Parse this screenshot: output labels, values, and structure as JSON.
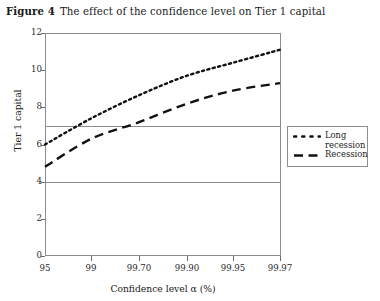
{
  "figure": {
    "label": "Figure 4",
    "caption": "The effect of the confidence level on Tier 1 capital"
  },
  "chart_data": {
    "type": "line",
    "title": "The effect of the confidence level on Tier 1 capital",
    "xlabel": "Confidence level α (%)",
    "ylabel": "Tier 1 capital",
    "categories": [
      "95",
      "99",
      "99.70",
      "99.90",
      "99.95",
      "99.97"
    ],
    "x_tick_labels": [
      "95",
      "99",
      "99.70",
      "99.90",
      "99.95",
      "99.97"
    ],
    "y_tick_labels": [
      "0",
      "2",
      "4",
      "6",
      "8",
      "10",
      "12"
    ],
    "y_ticks": [
      0,
      2,
      4,
      6,
      8,
      10,
      12
    ],
    "ylim": [
      0,
      12
    ],
    "gridlines_y": [
      4,
      7
    ],
    "grid": "horizontal",
    "legend_position": "right",
    "series": [
      {
        "name": "Long recession",
        "style": "dotted",
        "color": "#111111",
        "values": [
          6.0,
          7.4,
          8.65,
          9.7,
          10.4,
          11.1
        ]
      },
      {
        "name": "Recession",
        "style": "dashed",
        "color": "#111111",
        "values": [
          4.8,
          6.3,
          7.2,
          8.2,
          8.9,
          9.3
        ]
      }
    ]
  },
  "legend": {
    "items": [
      {
        "label": "Long\nrecession",
        "style": "dotted"
      },
      {
        "label": "Recession",
        "style": "dashed"
      }
    ]
  },
  "axes": {
    "x_title": "Confidence level α (%)",
    "y_title": "Tier 1 capital"
  },
  "colors": {
    "frame": "#8c8c8c",
    "series": "#111111",
    "text": "#1a1a1a"
  }
}
